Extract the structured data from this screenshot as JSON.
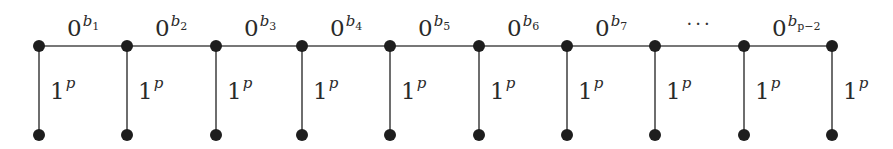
{
  "diagram": {
    "type": "comb-graph",
    "top_y": 46,
    "bottom_y": 135,
    "node_xs": [
      39,
      127,
      216,
      302,
      390,
      479,
      567,
      655,
      744,
      832
    ],
    "top_edges": [
      {
        "base": "0",
        "sup": "b",
        "sub": "1"
      },
      {
        "base": "0",
        "sup": "b",
        "sub": "2"
      },
      {
        "base": "0",
        "sup": "b",
        "sub": "3"
      },
      {
        "base": "0",
        "sup": "b",
        "sub": "4"
      },
      {
        "base": "0",
        "sup": "b",
        "sub": "5"
      },
      {
        "base": "0",
        "sup": "b",
        "sub": "6"
      },
      {
        "base": "0",
        "sup": "b",
        "sub": "7"
      },
      {
        "ellipsis": "···"
      },
      {
        "base": "0",
        "sup": "b",
        "sub": "p−2"
      }
    ],
    "vertical_edges": [
      {
        "base": "1",
        "sup": "p"
      },
      {
        "base": "1",
        "sup": "p"
      },
      {
        "base": "1",
        "sup": "p"
      },
      {
        "base": "1",
        "sup": "p"
      },
      {
        "base": "1",
        "sup": "p"
      },
      {
        "base": "1",
        "sup": "p"
      },
      {
        "base": "1",
        "sup": "p"
      },
      {
        "base": "1",
        "sup": "p"
      },
      {
        "base": "1",
        "sup": "p"
      },
      {
        "base": "1",
        "sup": "p"
      }
    ]
  }
}
